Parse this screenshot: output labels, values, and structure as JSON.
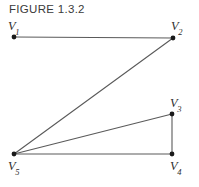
{
  "figure": {
    "caption": "FIGURE 1.3.2",
    "background_color": "#ffffff",
    "line_color": "#5a5a5a",
    "node_color": "#1a1a1a",
    "label_color": "#2e2e2e"
  },
  "graph": {
    "vertices": [
      {
        "id": "V1",
        "letter": "V",
        "subscript": "1",
        "x": 14,
        "y": 37,
        "label_position": "above-left"
      },
      {
        "id": "V2",
        "letter": "V",
        "subscript": "2",
        "x": 173,
        "y": 38,
        "label_position": "above-right"
      },
      {
        "id": "V3",
        "letter": "V",
        "subscript": "3",
        "x": 172,
        "y": 114,
        "label_position": "above-right"
      },
      {
        "id": "V4",
        "letter": "V",
        "subscript": "4",
        "x": 172,
        "y": 154,
        "label_position": "below-right"
      },
      {
        "id": "V5",
        "letter": "V",
        "subscript": "5",
        "x": 14,
        "y": 154,
        "label_position": "below-left"
      }
    ],
    "edges": [
      {
        "id": "e-v1-v2",
        "from": "V1",
        "to": "V2",
        "x1": 14,
        "y1": 37,
        "x2": 173,
        "y2": 38
      },
      {
        "id": "e-v2-v5",
        "from": "V2",
        "to": "V5",
        "x1": 173,
        "y1": 38,
        "x2": 14,
        "y2": 154
      },
      {
        "id": "e-v5-v3",
        "from": "V5",
        "to": "V3",
        "x1": 14,
        "y1": 154,
        "x2": 172,
        "y2": 114
      },
      {
        "id": "e-v3-v4",
        "from": "V3",
        "to": "V4",
        "x1": 172,
        "y1": 114,
        "x2": 172,
        "y2": 154
      },
      {
        "id": "e-v5-v4",
        "from": "V5",
        "to": "V4",
        "x1": 14,
        "y1": 154,
        "x2": 172,
        "y2": 154
      }
    ]
  }
}
